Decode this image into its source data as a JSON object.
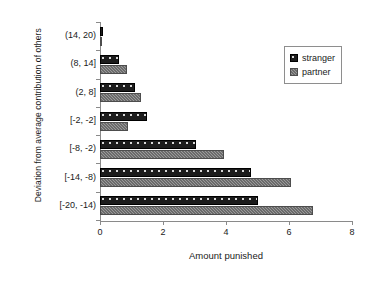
{
  "chart_data": {
    "type": "bar",
    "orientation": "horizontal",
    "title": "",
    "xlabel": "Amount punished",
    "ylabel": "Deviation from average contribution of others",
    "categories": [
      "(14, 20)",
      "(8, 14]",
      "(2, 8]",
      "[-2, -2]",
      "[-8, -2)",
      "[-14, -8)",
      "[-20, -14)"
    ],
    "series": [
      {
        "name": "stranger",
        "color": "#1c1c1c",
        "values": [
          0.1,
          0.6,
          1.1,
          1.5,
          3.05,
          4.8,
          5.0
        ]
      },
      {
        "name": "partner",
        "color": "#9a9a9a",
        "values": [
          0.02,
          0.85,
          1.3,
          0.9,
          3.95,
          6.05,
          6.75
        ]
      }
    ],
    "xlim": [
      0,
      8
    ],
    "xticks": [
      0,
      2,
      4,
      6,
      8
    ],
    "xtick_labels": [
      "0",
      "2",
      "4",
      "6",
      "8"
    ],
    "grid": false,
    "legend_position": "top-right"
  },
  "legend": {
    "entries": [
      {
        "label": "stranger",
        "swatch": "stranger-swatch"
      },
      {
        "label": "partner",
        "swatch": "partner-swatch"
      }
    ]
  },
  "axes": {
    "x_title": "Amount punished",
    "y_title": "Deviation from average contribution of others"
  }
}
